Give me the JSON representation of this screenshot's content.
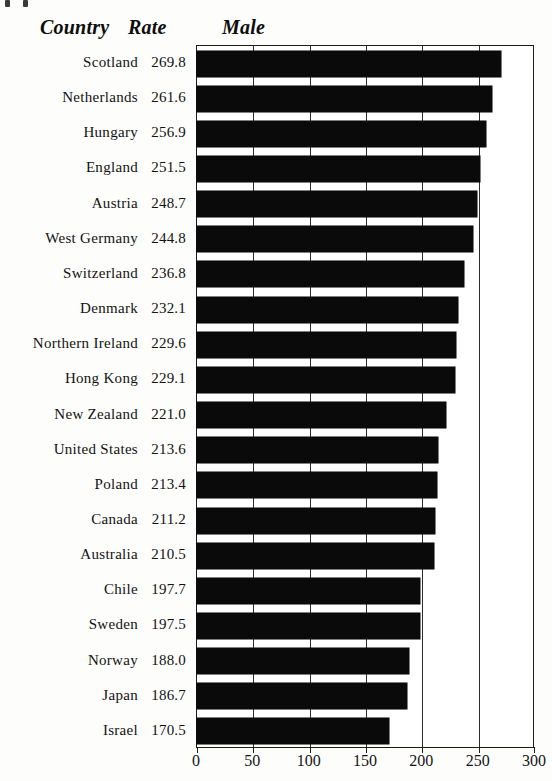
{
  "header": {
    "country_label": "Country",
    "rate_label": "Rate",
    "series_label": "Male"
  },
  "chart_data": {
    "type": "bar",
    "orientation": "horizontal",
    "title": "Male",
    "xlabel": "",
    "ylabel": "Country",
    "xlim": [
      0,
      300
    ],
    "xticks": [
      "0",
      "50",
      "100",
      "150",
      "200",
      "250",
      "300"
    ],
    "grid": true,
    "legend": "none",
    "value_column_header": "Rate",
    "category_column_header": "Country",
    "categories": [
      "Scotland",
      "Netherlands",
      "Hungary",
      "England",
      "Austria",
      "West Germany",
      "Switzerland",
      "Denmark",
      "Northern Ireland",
      "Hong Kong",
      "New Zealand",
      "United States",
      "Poland",
      "Canada",
      "Australia",
      "Chile",
      "Sweden",
      "Norway",
      "Japan",
      "Israel"
    ],
    "values": [
      269.8,
      261.6,
      256.9,
      251.5,
      248.7,
      244.8,
      236.8,
      232.1,
      229.6,
      229.1,
      221.0,
      213.6,
      213.4,
      211.2,
      210.5,
      197.7,
      197.5,
      188.0,
      186.7,
      170.5
    ],
    "value_labels": [
      "269.8",
      "261.6",
      "256.9",
      "251.5",
      "248.7",
      "244.8",
      "236.8",
      "232.1",
      "229.6",
      "229.1",
      "221.0",
      "213.6",
      "213.4",
      "211.2",
      "210.5",
      "197.7",
      "197.5",
      "188.0",
      "186.7",
      "170.5"
    ],
    "bar_color": "#0a0a0a",
    "frame_color": "#1b1b1b",
    "background_color": "#ffffff"
  }
}
